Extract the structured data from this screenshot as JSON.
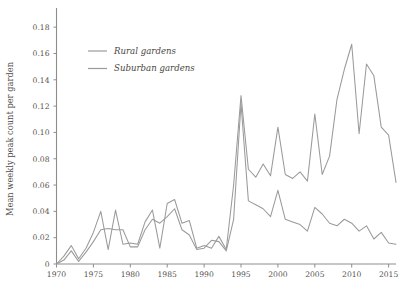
{
  "chart_data": {
    "type": "line",
    "title": "",
    "xlabel": "",
    "ylabel": "Mean weekly peak count per garden",
    "xlim": [
      1970,
      2016
    ],
    "ylim": [
      0,
      0.19
    ],
    "grid": false,
    "legend_position": "top-left-inside",
    "x_ticks": [
      1970,
      1975,
      1980,
      1985,
      1990,
      1995,
      2000,
      2005,
      2010,
      2015
    ],
    "x_tick_labels": [
      "1970",
      "1975",
      "1980",
      "1985",
      "1990",
      "1995",
      "2000",
      "2005",
      "2010",
      "2015"
    ],
    "y_ticks": [
      0,
      0.02,
      0.04,
      0.06,
      0.08,
      0.1,
      0.12,
      0.14,
      0.16,
      0.18
    ],
    "y_tick_labels": [
      "0",
      "0.02",
      "0.04",
      "0.06",
      "0.08",
      "0.10",
      "0.12",
      "0.14",
      "0.16",
      "0.18"
    ],
    "x": [
      1970,
      1971,
      1972,
      1973,
      1974,
      1975,
      1976,
      1977,
      1978,
      1979,
      1980,
      1981,
      1982,
      1983,
      1984,
      1985,
      1986,
      1987,
      1988,
      1989,
      1990,
      1991,
      1992,
      1993,
      1994,
      1995,
      1996,
      1997,
      1998,
      1999,
      2000,
      2001,
      2002,
      2003,
      2004,
      2005,
      2006,
      2007,
      2008,
      2009,
      2010,
      2011,
      2012,
      2013,
      2014,
      2015,
      2016
    ],
    "series": [
      {
        "name": "Rural gardens",
        "color": "#9a9a9a",
        "values": [
          0.0,
          0.006,
          0.014,
          0.004,
          0.012,
          0.024,
          0.04,
          0.011,
          0.041,
          0.015,
          0.016,
          0.015,
          0.032,
          0.041,
          0.012,
          0.046,
          0.049,
          0.031,
          0.033,
          0.012,
          0.014,
          0.012,
          0.021,
          0.011,
          0.06,
          0.128,
          0.072,
          0.066,
          0.076,
          0.067,
          0.104,
          0.068,
          0.065,
          0.07,
          0.063,
          0.114,
          0.068,
          0.082,
          0.125,
          0.148,
          0.167,
          0.099,
          0.152,
          0.143,
          0.104,
          0.098,
          0.062
        ]
      },
      {
        "name": "Suburban gardens",
        "color": "#9a9a9a",
        "values": [
          0.0,
          0.003,
          0.01,
          0.002,
          0.009,
          0.017,
          0.026,
          0.027,
          0.026,
          0.026,
          0.013,
          0.013,
          0.026,
          0.034,
          0.031,
          0.036,
          0.042,
          0.026,
          0.022,
          0.011,
          0.012,
          0.018,
          0.017,
          0.01,
          0.034,
          0.122,
          0.048,
          0.045,
          0.042,
          0.036,
          0.056,
          0.034,
          0.032,
          0.03,
          0.025,
          0.043,
          0.038,
          0.031,
          0.029,
          0.034,
          0.031,
          0.025,
          0.029,
          0.019,
          0.024,
          0.016,
          0.015
        ]
      }
    ]
  },
  "legend": {
    "items": [
      {
        "label": "Rural gardens"
      },
      {
        "label": "Suburban gardens"
      }
    ]
  },
  "axes": {
    "y_title": "Mean weekly peak count per garden"
  },
  "colors": {
    "line": "#9a9a9a",
    "axis": "#8d8d8d",
    "text": "#4f4c48",
    "background": "#ffffff"
  }
}
